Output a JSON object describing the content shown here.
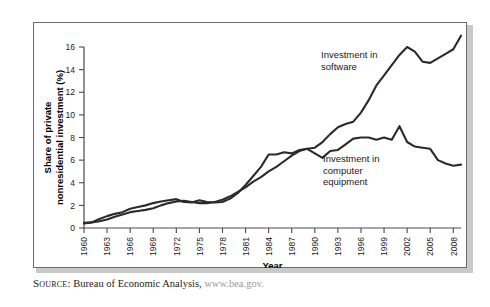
{
  "source_note": {
    "label": "Source:",
    "text": "Bureau of Economic Analysis,",
    "url": "www.bea.gov."
  },
  "chart_data": {
    "type": "line",
    "title": "",
    "xlabel": "Year",
    "ylabel": "Share of private nonresidential investment (%)",
    "xlim": [
      1960,
      2009
    ],
    "ylim": [
      0,
      16
    ],
    "ytick_labels": [
      "0",
      "2",
      "4",
      "6",
      "8",
      "10",
      "12",
      "14",
      "16"
    ],
    "yticks": [
      0,
      2,
      4,
      6,
      8,
      10,
      12,
      14,
      16
    ],
    "xtick_labels": [
      "1960",
      "1963",
      "1966",
      "1969",
      "1972",
      "1975",
      "1978",
      "1981",
      "1984",
      "1987",
      "1990",
      "1993",
      "1996",
      "1999",
      "2002",
      "2005",
      "2008"
    ],
    "xticks": [
      1960,
      1963,
      1966,
      1969,
      1972,
      1975,
      1978,
      1981,
      1984,
      1987,
      1990,
      1993,
      1996,
      1999,
      2002,
      2005,
      2008
    ],
    "grid": false,
    "legend_position": "annotations-inline",
    "line_color": "#2b2b2b",
    "annotations": [
      {
        "name": "software-annotation",
        "text": "Investment in software",
        "lines": [
          "Investment in",
          "software"
        ]
      },
      {
        "name": "computer-equipment-annotation",
        "text": "Investment in computer equipment",
        "lines": [
          "Investment in",
          "computer",
          "equipment"
        ]
      }
    ],
    "x": [
      1960,
      1961,
      1962,
      1963,
      1964,
      1965,
      1966,
      1967,
      1968,
      1969,
      1970,
      1971,
      1972,
      1973,
      1974,
      1975,
      1976,
      1977,
      1978,
      1979,
      1980,
      1981,
      1982,
      1983,
      1984,
      1985,
      1986,
      1987,
      1988,
      1989,
      1990,
      1991,
      1992,
      1993,
      1994,
      1995,
      1996,
      1997,
      1998,
      1999,
      2000,
      2001,
      2002,
      2003,
      2004,
      2005,
      2006,
      2007,
      2008,
      2009
    ],
    "series": [
      {
        "name": "Investment in software",
        "values": [
          0.45,
          0.5,
          0.6,
          0.75,
          1.0,
          1.2,
          1.4,
          1.5,
          1.6,
          1.75,
          2.0,
          2.2,
          2.35,
          2.4,
          2.3,
          2.2,
          2.2,
          2.3,
          2.5,
          2.8,
          3.2,
          3.6,
          4.1,
          4.5,
          5.0,
          5.4,
          5.9,
          6.4,
          6.8,
          7.0,
          7.1,
          7.6,
          8.3,
          8.9,
          9.2,
          9.4,
          10.2,
          11.3,
          12.6,
          13.5,
          14.4,
          15.3,
          16.0,
          15.6,
          14.7,
          14.6,
          15.0,
          15.4,
          15.8,
          17.0
        ]
      },
      {
        "name": "Investment in computer equipment",
        "values": [
          0.4,
          0.5,
          0.8,
          1.05,
          1.25,
          1.4,
          1.7,
          1.85,
          2.0,
          2.2,
          2.35,
          2.45,
          2.55,
          2.3,
          2.25,
          2.45,
          2.3,
          2.25,
          2.3,
          2.6,
          3.1,
          3.8,
          4.6,
          5.4,
          6.5,
          6.5,
          6.7,
          6.6,
          6.9,
          7.0,
          6.6,
          6.2,
          6.8,
          6.9,
          7.4,
          7.9,
          8.0,
          8.0,
          7.8,
          8.0,
          7.8,
          9.0,
          7.6,
          7.2,
          7.1,
          7.0,
          6.0,
          5.7,
          5.5,
          5.6
        ]
      }
    ]
  }
}
